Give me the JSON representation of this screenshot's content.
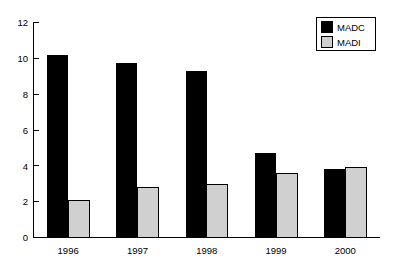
{
  "chart_data": {
    "type": "bar",
    "title": "",
    "subtitle": "",
    "xlabel": "",
    "ylabel": "",
    "categories": [
      "1996",
      "1997",
      "1998",
      "1999",
      "2000"
    ],
    "series": [
      {
        "name": "MADC",
        "color": "#000000",
        "values": [
          10.2,
          9.75,
          9.3,
          4.7,
          3.85
        ]
      },
      {
        "name": "MADI",
        "color": "#d0d0d0",
        "values": [
          2.05,
          2.8,
          2.95,
          3.6,
          3.9
        ]
      }
    ],
    "ylim": [
      0,
      12
    ],
    "yticks": [
      0,
      2,
      4,
      6,
      8,
      10,
      12
    ],
    "ytick_labels": [
      "0",
      "2",
      "4",
      "6",
      "8",
      "10",
      "12"
    ],
    "grid": false,
    "legend_position": "top-right",
    "bar_border_color": "#000000",
    "axis_color": "#000000",
    "background": "#ffffff"
  },
  "legend": {
    "entries": [
      {
        "label": "MADC",
        "swatch": "#000000"
      },
      {
        "label": "MADI",
        "swatch": "#d0d0d0"
      }
    ]
  },
  "axes": {
    "y_tick_labels": [
      "12",
      "10",
      "8",
      "6",
      "4",
      "2",
      "0"
    ],
    "x_tick_labels": [
      "1996",
      "1997",
      "1998",
      "1999",
      "2000"
    ]
  }
}
